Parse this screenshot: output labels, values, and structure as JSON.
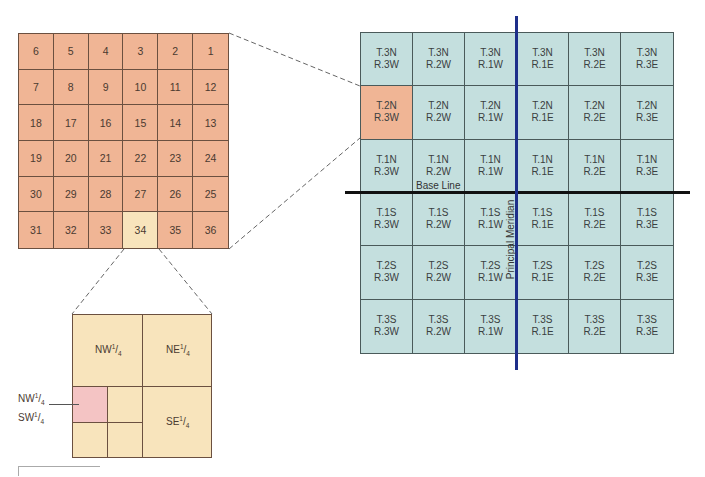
{
  "colors": {
    "section_fill": "#f0b595",
    "section_highlight": "#f8e4bc",
    "township_fill": "#c4dfde",
    "township_highlight": "#f0b595",
    "quarter_fill": "#f8e4bc",
    "subquarter_highlight": "#f4c4c4",
    "meridian_line": "#1e2f8a",
    "base_line": "#111111"
  },
  "sections": {
    "rows": [
      [
        "6",
        "5",
        "4",
        "3",
        "2",
        "1"
      ],
      [
        "7",
        "8",
        "9",
        "10",
        "11",
        "12"
      ],
      [
        "18",
        "17",
        "16",
        "15",
        "14",
        "13"
      ],
      [
        "19",
        "20",
        "21",
        "22",
        "23",
        "24"
      ],
      [
        "30",
        "29",
        "28",
        "27",
        "26",
        "25"
      ],
      [
        "31",
        "32",
        "33",
        "34",
        "35",
        "36"
      ]
    ],
    "highlighted": "34"
  },
  "townships": {
    "rows": [
      [
        [
          "T.3N",
          "R.3W"
        ],
        [
          "T.3N",
          "R.2W"
        ],
        [
          "T.3N",
          "R.1W"
        ],
        [
          "T.3N",
          "R.1E"
        ],
        [
          "T.3N",
          "R.2E"
        ],
        [
          "T.3N",
          "R.3E"
        ]
      ],
      [
        [
          "T.2N",
          "R.3W"
        ],
        [
          "T.2N",
          "R.2W"
        ],
        [
          "T.2N",
          "R.1W"
        ],
        [
          "T.2N",
          "R.1E"
        ],
        [
          "T.2N",
          "R.2E"
        ],
        [
          "T.2N",
          "R.3E"
        ]
      ],
      [
        [
          "T.1N",
          "R.3W"
        ],
        [
          "T.1N",
          "R.2W"
        ],
        [
          "T.1N",
          "R.1W"
        ],
        [
          "T.1N",
          "R.1E"
        ],
        [
          "T.1N",
          "R.2E"
        ],
        [
          "T.1N",
          "R.3E"
        ]
      ],
      [
        [
          "T.1S",
          "R.3W"
        ],
        [
          "T.1S",
          "R.2W"
        ],
        [
          "T.1S",
          "R.1W"
        ],
        [
          "T.1S",
          "R.1E"
        ],
        [
          "T.1S",
          "R.2E"
        ],
        [
          "T.1S",
          "R.3E"
        ]
      ],
      [
        [
          "T.2S",
          "R.3W"
        ],
        [
          "T.2S",
          "R.2W"
        ],
        [
          "T.2S",
          "R.1W"
        ],
        [
          "T.2S",
          "R.1E"
        ],
        [
          "T.2S",
          "R.2E"
        ],
        [
          "T.2S",
          "R.3E"
        ]
      ],
      [
        [
          "T.3S",
          "R.3W"
        ],
        [
          "T.3S",
          "R.2W"
        ],
        [
          "T.3S",
          "R.1W"
        ],
        [
          "T.3S",
          "R.1E"
        ],
        [
          "T.3S",
          "R.2E"
        ],
        [
          "T.3S",
          "R.3E"
        ]
      ]
    ],
    "highlighted": "T.2N R.3W"
  },
  "labels": {
    "base_line": "Base Line",
    "principal_meridian": "Principal Meridian"
  },
  "quarters": {
    "nw": {
      "prefix": "NW",
      "num": "1",
      "den": "4"
    },
    "ne": {
      "prefix": "NE",
      "num": "1",
      "den": "4"
    },
    "se": {
      "prefix": "SE",
      "num": "1",
      "den": "4"
    },
    "callout_line1": {
      "prefix": "NW",
      "num": "1",
      "den": "4"
    },
    "callout_line2": {
      "prefix": "SW",
      "num": "1",
      "den": "4"
    }
  }
}
